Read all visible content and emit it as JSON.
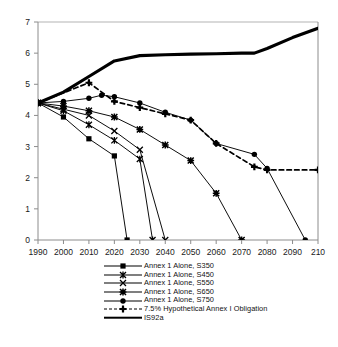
{
  "chart_data": {
    "type": "line",
    "title": "",
    "xlabel": "",
    "ylabel": "",
    "xlim": [
      1990,
      2100
    ],
    "ylim": [
      0,
      7
    ],
    "grid": false,
    "legend_position": "bottom",
    "x_ticks": [
      "1990",
      "2000",
      "2010",
      "2020",
      "2030",
      "2040",
      "2050",
      "2060",
      "2070",
      "2080",
      "2090",
      "210"
    ],
    "x_tick_values": [
      1990,
      2000,
      2010,
      2020,
      2030,
      2040,
      2050,
      2060,
      2070,
      2080,
      2090,
      2100
    ],
    "y_ticks": [
      "0",
      "1",
      "2",
      "3",
      "4",
      "5",
      "6",
      "7"
    ],
    "y_tick_values": [
      0,
      1,
      2,
      3,
      4,
      5,
      6,
      7
    ],
    "series": [
      {
        "name": "Annex 1 Alone, S350",
        "marker": "filled-square",
        "linestyle": "solid",
        "color": "#000000",
        "x": [
          1990,
          2000,
          2010,
          2020,
          2025
        ],
        "values": [
          4.4,
          3.95,
          3.25,
          2.7,
          0.0
        ]
      },
      {
        "name": "Annex 1 Alone, S450",
        "marker": "asterisk",
        "linestyle": "solid",
        "color": "#000000",
        "x": [
          1990,
          2000,
          2010,
          2020,
          2030,
          2035
        ],
        "values": [
          4.4,
          4.15,
          3.7,
          3.2,
          2.6,
          0.0
        ]
      },
      {
        "name": "Annex 1 Alone, S550",
        "marker": "x",
        "linestyle": "solid",
        "color": "#000000",
        "x": [
          1990,
          2000,
          2010,
          2020,
          2030,
          2040
        ],
        "values": [
          4.4,
          4.2,
          4.0,
          3.5,
          2.9,
          0.0
        ]
      },
      {
        "name": "Annex 1 Alone, S650",
        "marker": "star",
        "linestyle": "solid",
        "color": "#000000",
        "x": [
          1990,
          2000,
          2010,
          2020,
          2030,
          2040,
          2050,
          2060,
          2070
        ],
        "values": [
          4.4,
          4.3,
          4.15,
          3.95,
          3.55,
          3.05,
          2.55,
          1.5,
          0.0
        ]
      },
      {
        "name": "Annex 1 Alone, S750",
        "marker": "filled-circle",
        "linestyle": "solid",
        "color": "#000000",
        "x": [
          1990,
          2000,
          2010,
          2015,
          2020,
          2030,
          2040,
          2050,
          2060,
          2075,
          2080,
          2095
        ],
        "values": [
          4.4,
          4.45,
          4.55,
          4.65,
          4.6,
          4.4,
          4.1,
          3.85,
          3.1,
          2.75,
          2.3,
          0.0
        ]
      },
      {
        "name": "7.5% Hypothetical Annex I Obligation",
        "marker": "plus-filled",
        "linestyle": "dashed",
        "color": "#000000",
        "x": [
          1990,
          2010,
          2020,
          2030,
          2040,
          2050,
          2060,
          2075,
          2080,
          2100
        ],
        "values": [
          4.4,
          5.05,
          4.45,
          4.25,
          4.05,
          3.85,
          3.1,
          2.35,
          2.25,
          2.25
        ]
      },
      {
        "name": "IS92a",
        "marker": "none",
        "linestyle": "thick-solid",
        "color": "#000000",
        "x": [
          1990,
          2000,
          2010,
          2020,
          2030,
          2040,
          2050,
          2060,
          2070,
          2075,
          2080,
          2090,
          2100
        ],
        "values": [
          4.4,
          4.75,
          5.25,
          5.75,
          5.92,
          5.95,
          5.97,
          5.98,
          6.0,
          6.0,
          6.15,
          6.5,
          6.8
        ]
      }
    ]
  },
  "legend": {
    "items": [
      {
        "label": "Annex 1 Alone, S350",
        "key": "line-filled-square"
      },
      {
        "label": "Annex 1 Alone, S450",
        "key": "line-asterisk"
      },
      {
        "label": "Annex 1 Alone, S550",
        "key": "line-x"
      },
      {
        "label": "Annex 1 Alone, S650",
        "key": "line-star"
      },
      {
        "label": "Annex 1 Alone, S750",
        "key": "line-filled-circle"
      },
      {
        "label": "7.5% Hypothetical Annex I Obligation",
        "key": "dashed-plus"
      },
      {
        "label": "IS92a",
        "key": "thick-line"
      }
    ]
  }
}
